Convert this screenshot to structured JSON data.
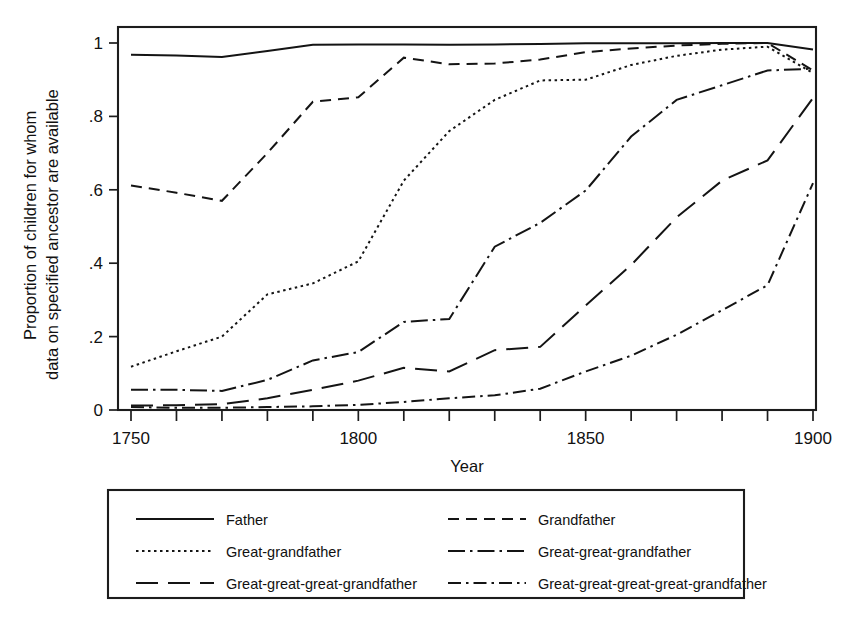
{
  "chart_data": {
    "type": "line",
    "title": "",
    "xlabel": "Year",
    "ylabel_line1": "Proportion of children for whom",
    "ylabel_line2": "data on specified ancestor are available",
    "xlim": [
      1750,
      1900
    ],
    "ylim": [
      0,
      1
    ],
    "grid": false,
    "legend_position": "below-plot",
    "xticks_major": [
      1750,
      1800,
      1850,
      1900
    ],
    "xticks_major_labels": [
      "1750",
      "1800",
      "1850",
      "1900"
    ],
    "xticks_minor": [
      1760,
      1770,
      1780,
      1790,
      1810,
      1820,
      1830,
      1840,
      1860,
      1870,
      1880,
      1890
    ],
    "yticks": [
      0,
      0.2,
      0.4,
      0.6,
      0.8,
      1
    ],
    "ytick_labels": [
      "0",
      ".2",
      ".4",
      ".6",
      ".8",
      "1"
    ],
    "x": [
      1750,
      1760,
      1770,
      1780,
      1790,
      1800,
      1810,
      1820,
      1830,
      1840,
      1850,
      1860,
      1870,
      1880,
      1890,
      1900
    ],
    "series": [
      {
        "name": "Father",
        "dash": "solid",
        "dasharray": "none",
        "values": [
          0.968,
          0.966,
          0.962,
          0.978,
          0.995,
          0.996,
          0.996,
          0.995,
          0.996,
          0.997,
          0.999,
          0.999,
          0.999,
          1.0,
          1.0,
          0.982
        ]
      },
      {
        "name": "Grandfather",
        "dash": "dashed",
        "dasharray": "11,7",
        "values": [
          0.612,
          0.592,
          0.57,
          0.7,
          0.84,
          0.852,
          0.96,
          0.942,
          0.944,
          0.955,
          0.975,
          0.985,
          0.993,
          0.998,
          1.0,
          0.925
        ]
      },
      {
        "name": "Great-grandfather",
        "dash": "dotted",
        "dasharray": "2.5,3.5",
        "values": [
          0.118,
          0.16,
          0.2,
          0.315,
          0.345,
          0.405,
          0.625,
          0.76,
          0.845,
          0.898,
          0.9,
          0.94,
          0.965,
          0.982,
          0.99,
          0.918
        ]
      },
      {
        "name": "Great-great-grandfather",
        "dash": "dash-dot",
        "dasharray": "17,5,2.5,5",
        "values": [
          0.055,
          0.055,
          0.052,
          0.082,
          0.135,
          0.158,
          0.24,
          0.248,
          0.445,
          0.51,
          0.598,
          0.745,
          0.845,
          0.885,
          0.925,
          0.93
        ]
      },
      {
        "name": "Great-great-great-grandfather",
        "dash": "long-dash",
        "dasharray": "22,10",
        "values": [
          0.012,
          0.013,
          0.016,
          0.032,
          0.055,
          0.08,
          0.115,
          0.105,
          0.163,
          0.172,
          0.285,
          0.395,
          0.525,
          0.625,
          0.68,
          0.85
        ]
      },
      {
        "name": "Great-great-great-great-grandfather",
        "dash": "dash-dot-tight",
        "dasharray": "13,5,2.5,5",
        "values": [
          0.008,
          0.006,
          0.006,
          0.008,
          0.01,
          0.014,
          0.022,
          0.032,
          0.04,
          0.058,
          0.105,
          0.148,
          0.205,
          0.272,
          0.34,
          0.618
        ]
      }
    ]
  },
  "legend": {
    "entries": [
      {
        "label": "Father",
        "dasharray": "none"
      },
      {
        "label": "Grandfather",
        "dasharray": "11,7"
      },
      {
        "label": "Great-grandfather",
        "dasharray": "2.5,3.5"
      },
      {
        "label": "Great-great-grandfather",
        "dasharray": "17,5,2.5,5"
      },
      {
        "label": "Great-great-great-grandfather",
        "dasharray": "22,10"
      },
      {
        "label": "Great-great-great-great-grandfather",
        "dasharray": "13,5,2.5,5"
      }
    ]
  },
  "colors": {
    "ink": "#141414",
    "frame": "#1c1c1c",
    "background": "#ffffff"
  }
}
